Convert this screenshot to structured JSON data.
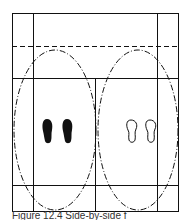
{
  "figure": {
    "caption": "Figure 12.4  Side-by-side f",
    "colors": {
      "line": "#111111",
      "fill_footprint": "#111111",
      "background": "#ffffff"
    },
    "elements": {
      "outer_frame": "rectangle",
      "top_dashed_line": "dashed horizontal",
      "left_zone_ellipse": "dash-dot ellipse",
      "right_zone_ellipse": "dash-dot ellipse",
      "left_footprints": "filled (black) pair",
      "right_footprints": "outlined (white) pair"
    }
  }
}
